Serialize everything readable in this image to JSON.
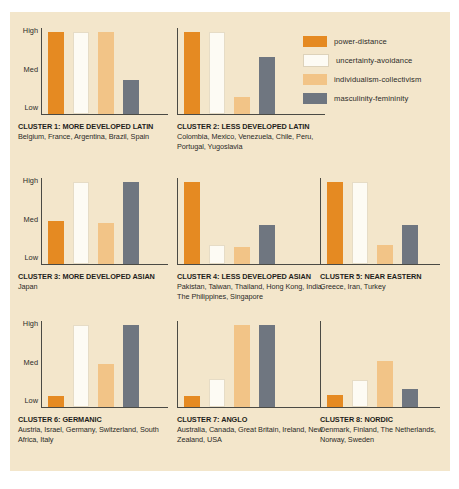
{
  "figure": {
    "background_color": "#ffffff",
    "panel_color": "#f3e6cb"
  },
  "legend": {
    "position": "top-right",
    "items": [
      {
        "label": "power-distance",
        "color": "#e58a22"
      },
      {
        "label": "uncertainty-avoidance",
        "color": "#fdfbf4"
      },
      {
        "label": "individualism-collectivism",
        "color": "#f2c487"
      },
      {
        "label": "masculinity-femininity",
        "color": "#6f7680"
      }
    ]
  },
  "axis": {
    "ticks": [
      "High",
      "Med",
      "Low"
    ]
  },
  "chart_data": {
    "type": "bar",
    "title": "",
    "subtitle": "",
    "xlabel": "",
    "ylabel": "",
    "ylim": [
      0,
      100
    ],
    "grid": false,
    "legend_position": "top-right",
    "tick_labels": [
      "Low",
      "Med",
      "High"
    ],
    "tick_values": [
      5,
      50,
      95
    ],
    "series": [
      {
        "name": "power-distance",
        "color": "#e58a22"
      },
      {
        "name": "uncertainty-avoidance",
        "color": "#fdfbf4"
      },
      {
        "name": "individualism-collectivism",
        "color": "#f2c487"
      },
      {
        "name": "masculinity-femininity",
        "color": "#6f7680"
      }
    ],
    "categories": [
      "CLUSTER 1: MORE DEVELOPED LATIN",
      "CLUSTER 2: LESS DEVELOPED LATIN",
      "CLUSTER 3: MORE DEVELOPED ASIAN",
      "CLUSTER 4: LESS DEVELOPED ASIAN",
      "CLUSTER 5: NEAR EASTERN",
      "CLUSTER 6: GERMANIC",
      "CLUSTER 7: ANGLO",
      "CLUSTER 8: NORDIC"
    ],
    "values": [
      [
        95,
        95,
        95,
        40
      ],
      [
        95,
        95,
        20,
        66
      ],
      [
        50,
        95,
        48,
        95
      ],
      [
        95,
        22,
        20,
        45
      ],
      [
        95,
        95,
        22,
        45
      ],
      [
        13,
        95,
        50,
        95
      ],
      [
        13,
        32,
        95,
        95
      ],
      [
        14,
        31,
        53,
        21
      ]
    ]
  },
  "clusters": [
    {
      "title": "CLUSTER 1: MORE DEVELOPED LATIN",
      "countries": "Belgium, France, Argentina, Brazil, Spain",
      "values": [
        95,
        95,
        95,
        40
      ]
    },
    {
      "title": "CLUSTER 2: LESS DEVELOPED LATIN",
      "countries": "Colombia, Mexico, Venezuela, Chile, Peru, Portugal, Yugoslavia",
      "values": [
        95,
        95,
        20,
        66
      ]
    },
    {
      "title": "CLUSTER 3: MORE DEVELOPED ASIAN",
      "countries": "Japan",
      "values": [
        50,
        95,
        48,
        95
      ]
    },
    {
      "title": "CLUSTER 4: LESS DEVELOPED ASIAN",
      "countries": "Pakistan, Taiwan, Thailand, Hong Kong, India, The Philippines, Singapore",
      "values": [
        95,
        22,
        20,
        45
      ]
    },
    {
      "title": "CLUSTER 5: NEAR EASTERN",
      "countries": "Greece, Iran, Turkey",
      "values": [
        95,
        95,
        22,
        45
      ]
    },
    {
      "title": "CLUSTER 6: GERMANIC",
      "countries": "Austria, Israel, Germany, Switzerland, South Africa, Italy",
      "values": [
        13,
        95,
        50,
        95
      ]
    },
    {
      "title": "CLUSTER 7: ANGLO",
      "countries": "Australia, Canada, Great Britain, Ireland, New Zealand, USA",
      "values": [
        13,
        32,
        95,
        95
      ]
    },
    {
      "title": "CLUSTER 8: NORDIC",
      "countries": "Denmark, Finland, The Netherlands, Norway, Sweden",
      "values": [
        14,
        31,
        53,
        21
      ]
    }
  ]
}
